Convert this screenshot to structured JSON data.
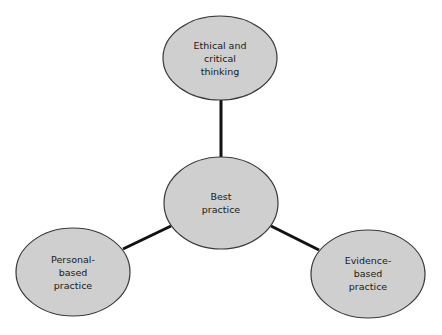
{
  "diagram": {
    "colors": {
      "node_fill": "#cfcfcf",
      "node_stroke": "#3a3a3a",
      "connector": "#111111",
      "background": "#ffffff"
    },
    "center_node": {
      "lines": [
        "Best",
        "practice"
      ]
    },
    "nodes": [
      {
        "id": "top",
        "lines": [
          "Ethical and",
          "critical",
          "thinking"
        ]
      },
      {
        "id": "left",
        "lines": [
          "Personal-",
          "based",
          "practice"
        ]
      },
      {
        "id": "right",
        "lines": [
          "Evidence-",
          "based",
          "practice"
        ]
      }
    ],
    "connectors": [
      {
        "from": "center",
        "to": "top"
      },
      {
        "from": "center",
        "to": "left"
      },
      {
        "from": "center",
        "to": "right"
      }
    ]
  }
}
